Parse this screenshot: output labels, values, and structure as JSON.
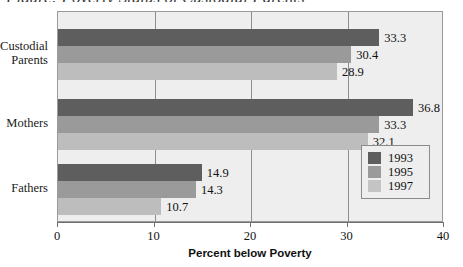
{
  "title_remnant": "Figure: Poverty Status of Custodial Parents",
  "chart_data": {
    "type": "bar",
    "orientation": "horizontal",
    "title": "",
    "xlabel": "Percent below Poverty",
    "ylabel": "",
    "xlim": [
      0,
      40
    ],
    "xticks": [
      "0",
      "10",
      "20",
      "30",
      "40"
    ],
    "grid": "vertical",
    "legend_position": "inside-bottom-right",
    "categories": [
      "Custodial\nParents",
      "Mothers",
      "Fathers"
    ],
    "series": [
      {
        "name": "1993",
        "color": "#5e5e5e",
        "values": [
          33.3,
          36.8,
          14.9
        ]
      },
      {
        "name": "1995",
        "color": "#9a9a9a",
        "values": [
          30.4,
          33.3,
          14.3
        ]
      },
      {
        "name": "1997",
        "color": "#bdbdbd",
        "values": [
          28.9,
          32.1,
          10.7
        ]
      }
    ],
    "data_labels": [
      [
        "33.3",
        "30.4",
        "28.9"
      ],
      [
        "36.8",
        "33.3",
        "32.1"
      ],
      [
        "14.9",
        "14.3",
        "10.7"
      ]
    ]
  },
  "categories": [
    {
      "label": "Custodial\nParents"
    },
    {
      "label": "Mothers"
    },
    {
      "label": "Fathers"
    }
  ],
  "legend": {
    "items": [
      {
        "label": "1993",
        "color": "#5e5e5e"
      },
      {
        "label": "1995",
        "color": "#9a9a9a"
      },
      {
        "label": "1997",
        "color": "#c4c4c4"
      }
    ]
  },
  "axis": {
    "x_title": "Percent below Poverty",
    "x_ticks": [
      "0",
      "10",
      "20",
      "30",
      "40"
    ]
  }
}
